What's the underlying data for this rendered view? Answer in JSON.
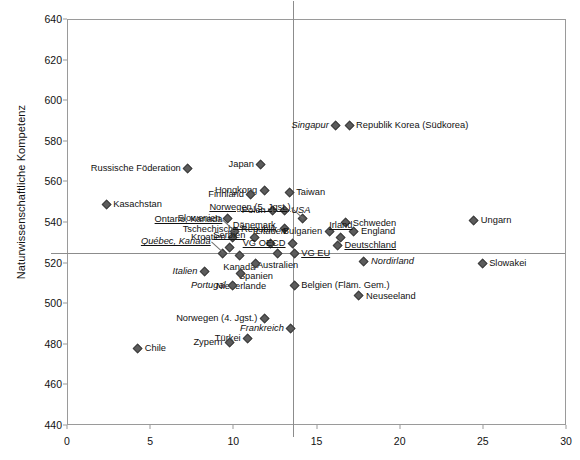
{
  "chart_data": {
    "type": "scatter",
    "title": "",
    "xlabel": "",
    "ylabel": "Naturwissenschaftliche Kompetenz",
    "xlim": [
      0,
      30
    ],
    "ylim": [
      440,
      640
    ],
    "xticks": [
      0,
      5,
      10,
      15,
      20,
      25,
      30
    ],
    "yticks": [
      440,
      460,
      480,
      500,
      520,
      540,
      560,
      580,
      600,
      620,
      640
    ],
    "grid": false,
    "legend": "none",
    "reference_lines": {
      "horizontal_y": 525,
      "vertical_x": 13.5
    },
    "points": [
      {
        "label": "Russische Föderation",
        "x": 7.2,
        "y": 567,
        "pos": "l",
        "style": "plain"
      },
      {
        "label": "Japan",
        "x": 11.6,
        "y": 569,
        "pos": "l",
        "style": "plain"
      },
      {
        "label": "Singapur",
        "x": 16.1,
        "y": 588,
        "pos": "l",
        "style": "italic"
      },
      {
        "label": "Republik Korea (Südkorea)",
        "x": 16.9,
        "y": 588,
        "pos": "r",
        "style": "plain"
      },
      {
        "label": "Hongkong",
        "x": 11.8,
        "y": 556,
        "pos": "l",
        "style": "plain"
      },
      {
        "label": "Finnland",
        "x": 11.0,
        "y": 554,
        "pos": "l",
        "style": "plain"
      },
      {
        "label": "Taiwan",
        "x": 13.3,
        "y": 555,
        "pos": "r",
        "style": "plain"
      },
      {
        "label": "Kasachstan",
        "x": 2.3,
        "y": 549,
        "pos": "r",
        "style": "plain"
      },
      {
        "label": "Polen",
        "x": 12.3,
        "y": 546,
        "pos": "l",
        "style": "plain"
      },
      {
        "label": "USA",
        "x": 13.0,
        "y": 546,
        "pos": "r",
        "style": "italic"
      },
      {
        "label": "Slowenien",
        "x": 9.6,
        "y": 542,
        "pos": "l",
        "style": "plain"
      },
      {
        "label": "Norwegen (5. Jgst.)",
        "x": 14.1,
        "y": 542,
        "pos": "leader-ul",
        "style": "underline"
      },
      {
        "label": "Schweden",
        "x": 16.7,
        "y": 540,
        "pos": "r",
        "style": "plain"
      },
      {
        "label": "Ungarn",
        "x": 24.4,
        "y": 541,
        "pos": "r",
        "style": "plain"
      },
      {
        "label": "Tschechische Republik",
        "x": 13.0,
        "y": 537,
        "pos": "l",
        "style": "plain"
      },
      {
        "label": "Ontario, Kanada",
        "x": 10.0,
        "y": 536,
        "pos": "leader-ul",
        "style": "underline"
      },
      {
        "label": "Bulgarien",
        "x": 15.7,
        "y": 536,
        "pos": "l",
        "style": "plain"
      },
      {
        "label": "England",
        "x": 17.2,
        "y": 536,
        "pos": "r",
        "style": "plain"
      },
      {
        "label": "Dänemark",
        "x": 11.2,
        "y": 533,
        "pos": "t",
        "style": "underline"
      },
      {
        "label": "Kroatien",
        "x": 9.9,
        "y": 533,
        "pos": "l",
        "style": "plain"
      },
      {
        "label": "Irland",
        "x": 16.4,
        "y": 533,
        "pos": "t",
        "style": "underline"
      },
      {
        "label": "Litauen",
        "x": 12.2,
        "y": 530,
        "pos": "t",
        "style": "italic"
      },
      {
        "label": "VG OECD",
        "x": 13.5,
        "y": 530,
        "pos": "l",
        "style": "underline"
      },
      {
        "label": "Deutschland",
        "x": 16.2,
        "y": 529,
        "pos": "r",
        "style": "underline"
      },
      {
        "label": "Serbien",
        "x": 9.7,
        "y": 528,
        "pos": "t",
        "style": "underline"
      },
      {
        "label": "Québec, Kanada",
        "x": 9.3,
        "y": 525,
        "pos": "leader-ul",
        "style": "underline-italic"
      },
      {
        "label": "Kanada",
        "x": 10.3,
        "y": 524,
        "pos": "b",
        "style": "plain"
      },
      {
        "label": "Australien",
        "x": 12.6,
        "y": 525,
        "pos": "b",
        "style": "plain"
      },
      {
        "label": "VG EU",
        "x": 13.6,
        "y": 525,
        "pos": "r",
        "style": "underline"
      },
      {
        "label": "Slowakei",
        "x": 24.9,
        "y": 520,
        "pos": "r",
        "style": "plain"
      },
      {
        "label": "Nordirland",
        "x": 17.8,
        "y": 521,
        "pos": "r",
        "style": "italic"
      },
      {
        "label": "Italien",
        "x": 8.2,
        "y": 516,
        "pos": "l",
        "style": "italic"
      },
      {
        "label": "Spanien",
        "x": 11.3,
        "y": 520,
        "pos": "b",
        "style": "plain"
      },
      {
        "label": "Niederlande",
        "x": 10.4,
        "y": 515,
        "pos": "b",
        "style": "plain"
      },
      {
        "label": "Belgien (Fläm. Gem.)",
        "x": 13.6,
        "y": 509,
        "pos": "r",
        "style": "plain"
      },
      {
        "label": "Portugal",
        "x": 9.9,
        "y": 509,
        "pos": "l",
        "style": "italic"
      },
      {
        "label": "Neuseeland",
        "x": 17.5,
        "y": 504,
        "pos": "r",
        "style": "plain"
      },
      {
        "label": "Norwegen (4. Jgst.)",
        "x": 11.8,
        "y": 493,
        "pos": "l",
        "style": "plain"
      },
      {
        "label": "Frankreich",
        "x": 13.4,
        "y": 488,
        "pos": "l",
        "style": "italic"
      },
      {
        "label": "Türkei",
        "x": 10.8,
        "y": 483,
        "pos": "l",
        "style": "plain"
      },
      {
        "label": "Zypern",
        "x": 9.7,
        "y": 481,
        "pos": "l",
        "style": "plain"
      },
      {
        "label": "Chile",
        "x": 4.2,
        "y": 478,
        "pos": "r",
        "style": "plain"
      }
    ]
  }
}
